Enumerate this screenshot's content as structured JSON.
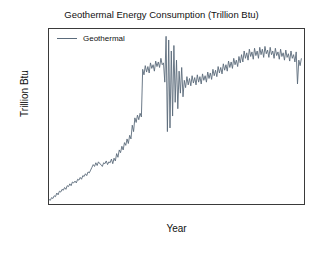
{
  "chart_data": {
    "type": "line",
    "title": "Geothermal Energy Consumption (Trillion Btu)",
    "xlabel": "Year",
    "ylabel": "Trillion Btu",
    "xlim": [
      1973.0,
      2022.0
    ],
    "ylim": [
      0.9,
      20.0
    ],
    "grid": false,
    "legend_position": "upper left",
    "line_color": "#5b6b7b",
    "xticks": [
      1980,
      1990,
      2000,
      2010,
      2020
    ],
    "xtick_labels": [
      "1980",
      "1990",
      "2000",
      "2010",
      "2020"
    ],
    "yticks": [
      2.5,
      5.0,
      7.5,
      10.0,
      12.5,
      15.0,
      17.5,
      20.0
    ],
    "ytick_labels": [
      "2.5",
      "5.0",
      "7.5",
      "10.0",
      "12.5",
      "15.0",
      "17.5",
      "20.0"
    ],
    "series": [
      {
        "name": "Geothermal",
        "color": "#5b6b7b",
        "x": [
          1973.0,
          1973.25,
          1973.5,
          1973.75,
          1974.0,
          1974.25,
          1974.5,
          1974.75,
          1975.0,
          1975.25,
          1975.5,
          1975.75,
          1976.0,
          1976.25,
          1976.5,
          1976.75,
          1977.0,
          1977.25,
          1977.5,
          1977.75,
          1978.0,
          1978.25,
          1978.5,
          1978.75,
          1979.0,
          1979.25,
          1979.5,
          1979.75,
          1980.0,
          1980.25,
          1980.5,
          1980.75,
          1981.0,
          1981.25,
          1981.5,
          1981.75,
          1982.0,
          1982.25,
          1982.5,
          1982.75,
          1983.0,
          1983.25,
          1983.5,
          1983.75,
          1984.0,
          1984.25,
          1984.5,
          1984.75,
          1985.0,
          1985.25,
          1985.5,
          1985.75,
          1986.0,
          1986.25,
          1986.5,
          1986.75,
          1987.0,
          1987.25,
          1987.5,
          1987.75,
          1988.0,
          1988.25,
          1988.5,
          1988.75,
          1989.0,
          1989.25,
          1989.5,
          1989.75,
          1990.0,
          1990.25,
          1990.5,
          1990.75,
          1991.0,
          1991.25,
          1991.5,
          1991.75,
          1992.0,
          1992.25,
          1992.5,
          1992.75,
          1993.0,
          1993.25,
          1993.5,
          1993.75,
          1994.0,
          1994.25,
          1994.5,
          1994.75,
          1995.0,
          1995.25,
          1995.5,
          1995.75,
          1996.0,
          1996.25,
          1996.5,
          1996.75,
          1997.0,
          1997.25,
          1997.5,
          1997.75,
          1998.0,
          1998.25,
          1998.5,
          1998.75,
          1999.0,
          1999.25,
          1999.5,
          1999.75,
          2000.0,
          2000.25,
          2000.5,
          2000.75,
          2001.0,
          2001.25,
          2001.5,
          2001.75,
          2002.0,
          2002.25,
          2002.5,
          2002.75,
          2003.0,
          2003.25,
          2003.5,
          2003.75,
          2004.0,
          2004.25,
          2004.5,
          2004.75,
          2005.0,
          2005.25,
          2005.5,
          2005.75,
          2006.0,
          2006.25,
          2006.5,
          2006.75,
          2007.0,
          2007.25,
          2007.5,
          2007.75,
          2008.0,
          2008.25,
          2008.5,
          2008.75,
          2009.0,
          2009.25,
          2009.5,
          2009.75,
          2010.0,
          2010.25,
          2010.5,
          2010.75,
          2011.0,
          2011.25,
          2011.5,
          2011.75,
          2012.0,
          2012.25,
          2012.5,
          2012.75,
          2013.0,
          2013.25,
          2013.5,
          2013.75,
          2014.0,
          2014.25,
          2014.5,
          2014.75,
          2015.0,
          2015.25,
          2015.5,
          2015.75,
          2016.0,
          2016.25,
          2016.5,
          2016.75,
          2017.0,
          2017.25,
          2017.5,
          2017.75,
          2018.0,
          2018.25,
          2018.5,
          2018.75,
          2019.0,
          2019.25,
          2019.5,
          2019.75,
          2020.0,
          2020.25,
          2020.5,
          2020.75,
          2021.0,
          2021.25,
          2021.5
        ],
        "values": [
          1.4,
          1.3,
          1.6,
          1.5,
          1.8,
          1.7,
          2.1,
          1.9,
          2.3,
          2.2,
          2.5,
          2.4,
          2.7,
          2.5,
          2.9,
          2.8,
          3.1,
          2.9,
          3.3,
          3.2,
          3.4,
          3.2,
          3.6,
          3.5,
          3.8,
          3.6,
          4.0,
          3.9,
          4.2,
          4.0,
          4.4,
          4.3,
          4.6,
          4.9,
          5.2,
          5.0,
          5.4,
          5.1,
          5.5,
          5.3,
          5.2,
          5.0,
          5.4,
          5.3,
          5.6,
          5.2,
          5.5,
          5.4,
          5.8,
          5.3,
          5.9,
          5.6,
          6.4,
          6.0,
          6.8,
          6.5,
          7.2,
          6.8,
          7.6,
          7.3,
          8.0,
          7.5,
          8.4,
          8.0,
          9.5,
          8.8,
          10.3,
          9.8,
          10.6,
          10.1,
          10.8,
          10.4,
          15.6,
          15.0,
          16.0,
          15.3,
          15.9,
          15.2,
          16.3,
          15.7,
          16.1,
          15.4,
          16.5,
          15.9,
          16.4,
          15.8,
          16.8,
          16.1,
          16.3,
          14.2,
          19.2,
          8.8,
          18.8,
          9.2,
          17.6,
          10.5,
          18.2,
          12.0,
          16.6,
          11.3,
          15.4,
          13.0,
          15.8,
          12.6,
          14.4,
          13.6,
          14.8,
          13.9,
          14.6,
          13.8,
          14.9,
          14.1,
          14.7,
          13.9,
          15.0,
          14.2,
          14.8,
          14.0,
          15.1,
          14.4,
          14.9,
          14.2,
          15.3,
          14.6,
          15.2,
          14.5,
          15.6,
          14.9,
          15.5,
          14.8,
          15.9,
          15.2,
          15.8,
          15.1,
          16.2,
          15.5,
          16.1,
          15.4,
          16.5,
          15.8,
          16.4,
          15.7,
          16.8,
          16.1,
          16.6,
          15.9,
          17.0,
          16.3,
          17.2,
          16.4,
          17.6,
          16.8,
          17.4,
          16.6,
          17.8,
          17.0,
          17.5,
          16.7,
          17.9,
          17.1,
          17.6,
          16.8,
          18.0,
          17.2,
          17.8,
          16.9,
          18.1,
          17.3,
          17.7,
          16.9,
          18.0,
          17.2,
          17.6,
          16.8,
          17.9,
          17.1,
          17.5,
          16.7,
          17.8,
          17.0,
          17.4,
          16.6,
          17.7,
          16.9,
          17.3,
          16.5,
          17.6,
          16.8,
          17.2,
          16.4,
          17.5,
          14.0,
          16.6,
          16.0,
          16.8
        ]
      }
    ]
  },
  "legend": {
    "entries": [
      {
        "label": "Geothermal",
        "color": "#5b6b7b"
      }
    ]
  }
}
